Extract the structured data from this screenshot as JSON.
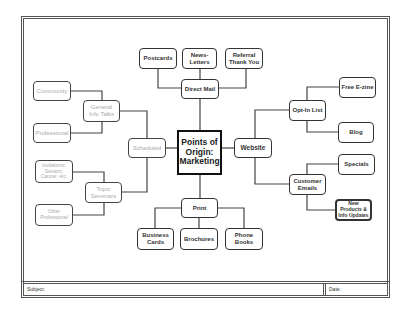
{
  "diagram": {
    "title": "Points of Origin: Marketing",
    "center": {
      "label": "Points of Origin: Marketing"
    },
    "nodes": {
      "direct_mail": "Direct Mail",
      "postcards": "Postcards",
      "newsletters": "News-Letters",
      "referral": "Referral Thank You",
      "scheduled": "Scheduled",
      "general_info": "General Info Talks",
      "community": "Community",
      "professional": "Professional",
      "topic_seminars": "Topic Seminars",
      "invitations": "Invitations: Seniors, Cancer, etc.",
      "other_professional": "Other Professional",
      "website": "Website",
      "opt_in": "Opt-In List",
      "free_ezine": "Free E-zine",
      "blog": "Blog",
      "customer_emails": "Customer Emails",
      "specials": "Specials",
      "new_products": "New Products & Info Updates",
      "print": "Print",
      "business_cards": "Business Cards",
      "brochures": "Brochures",
      "phone_books": "Phone Books"
    }
  },
  "footer": {
    "subject_label": "Subject:",
    "date_label": "Date:"
  }
}
